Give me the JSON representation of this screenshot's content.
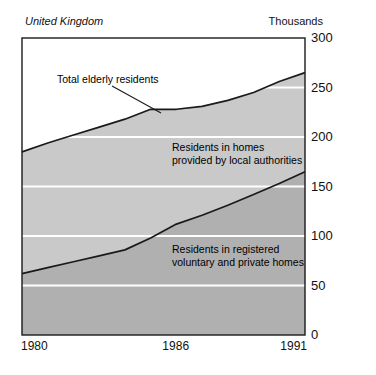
{
  "region_label": "United Kingdom",
  "unit_label": "Thousands",
  "annotations": {
    "total": "Total elderly residents",
    "local_authorities": "Residents in homes\nprovided by local authorities",
    "voluntary": "Residents in registered\nvoluntary and private homes"
  },
  "colors": {
    "band_upper": "#c9c9c9",
    "band_lower": "#b0b0b0",
    "line": "#1a1a1a",
    "gridline": "#ffffff",
    "axis": "#1a1a1a",
    "plot_background": "#ffffff"
  },
  "chart_data": {
    "type": "area",
    "title": "",
    "subtitle": "",
    "xlabel": "",
    "ylabel": "Thousands",
    "xlim": [
      1980,
      1991
    ],
    "ylim": [
      0,
      300
    ],
    "ytick_labels": [
      "300",
      "250",
      "200",
      "150",
      "100",
      "50",
      "0"
    ],
    "ytick_values": [
      300,
      250,
      200,
      150,
      100,
      50,
      0
    ],
    "xtick_labels": [
      "1980",
      "1986",
      "1991"
    ],
    "xtick_values": [
      1980,
      1986,
      1991
    ],
    "grid": true,
    "grid_color": "#ffffff",
    "legend": "inline-annotations",
    "stacked": true,
    "x": [
      1980,
      1981,
      1982,
      1983,
      1984,
      1985,
      1986,
      1987,
      1988,
      1989,
      1990,
      1991
    ],
    "series": [
      {
        "name": "Residents in registered voluntary and private homes",
        "values": [
          62,
          68,
          74,
          80,
          86,
          98,
          112,
          121,
          131,
          142,
          153,
          165
        ]
      },
      {
        "name": "Residents in homes provided by local authorities",
        "values": [
          123,
          126,
          128,
          130,
          132,
          130,
          116,
          110,
          106,
          103,
          103,
          100
        ]
      }
    ],
    "total_series": {
      "name": "Total elderly residents",
      "values": [
        185,
        194,
        202,
        210,
        218,
        228,
        228,
        231,
        237,
        245,
        256,
        265
      ]
    }
  }
}
